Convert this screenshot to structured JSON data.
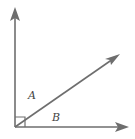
{
  "diagram": {
    "type": "geometry-angle",
    "labels": {
      "angle_a": "A",
      "angle_b": "B"
    },
    "right_angle_marker": true,
    "colors": {
      "stroke": "#6e6e6e",
      "label": "#444444",
      "background": "#ffffff"
    }
  }
}
